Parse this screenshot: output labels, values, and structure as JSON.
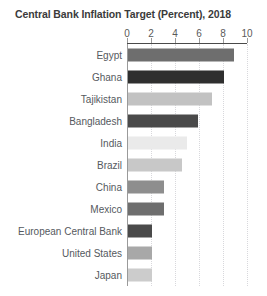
{
  "chart_data": {
    "type": "bar",
    "orientation": "horizontal",
    "title": "Central Bank Inflation Target (Percent), 2018",
    "xlabel": "",
    "ylabel": "",
    "xlim": [
      0,
      10
    ],
    "grid": true,
    "legend": false,
    "xticks": [
      "0",
      "2",
      "4",
      "6",
      "8",
      "10"
    ],
    "xtick_values": [
      0,
      2,
      4,
      6,
      8,
      10
    ],
    "categories": [
      "Egypt",
      "Ghana",
      "Tajikistan",
      "Bangladesh",
      "India",
      "Brazil",
      "China",
      "Mexico",
      "European Central Bank",
      "United States",
      "Japan"
    ],
    "values": [
      8.8,
      8.0,
      7.0,
      5.8,
      4.9,
      4.5,
      3.0,
      3.0,
      2.0,
      2.0,
      2.0
    ],
    "bar_colors": [
      "#6e6e6e",
      "#2f2f2f",
      "#c2c2c2",
      "#4a4a4a",
      "#eaeaea",
      "#c8c8c8",
      "#8e8e8e",
      "#6e6e6e",
      "#4a4a4a",
      "#a8a8a8",
      "#cccccc"
    ]
  },
  "style": {
    "background": "#ffffff",
    "title_color": "#3b3b3b",
    "label_color": "#55595e",
    "tick_color": "#5a5a5a",
    "grid_color": "#d8d8dc",
    "axis_color": "#9a9a9a"
  }
}
